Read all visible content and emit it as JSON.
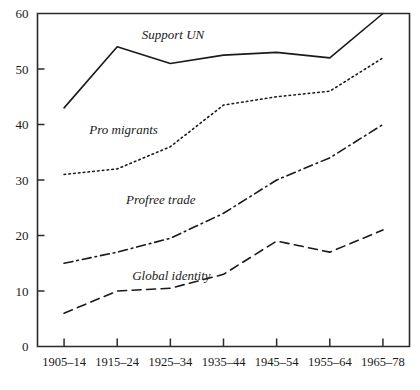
{
  "chart_data": {
    "type": "line",
    "title": "",
    "xlabel": "",
    "ylabel": "",
    "ylim": [
      0,
      60
    ],
    "y_ticks": [
      0,
      10,
      20,
      30,
      40,
      50,
      60
    ],
    "grid": false,
    "legend_position": "inline-labels",
    "categories": [
      "1905–14",
      "1915–24",
      "1925–34",
      "1935–44",
      "1945–54",
      "1955–64",
      "1965–78"
    ],
    "series": [
      {
        "name": "Support UN",
        "style": "solid",
        "color": "#1a1a1a",
        "values": [
          43,
          54,
          51,
          52.5,
          53,
          52,
          60
        ],
        "label_x_index": 2.05,
        "label_y": 55.4
      },
      {
        "name": "Pro migrants",
        "style": "dotted",
        "color": "#1a1a1a",
        "values": [
          31,
          32,
          36,
          43.5,
          45,
          46,
          52
        ],
        "label_x_index": 1.12,
        "label_y": 38.2
      },
      {
        "name": "Profree trade",
        "style": "dash-dot",
        "color": "#1a1a1a",
        "values": [
          15,
          17,
          19.5,
          24,
          30,
          34,
          40
        ],
        "label_x_index": 1.82,
        "label_y": 25.6
      },
      {
        "name": "Global identity",
        "style": "dashed",
        "color": "#1a1a1a",
        "values": [
          6,
          10,
          10.5,
          13,
          19,
          17,
          21
        ],
        "label_x_index": 2.02,
        "label_y": 11.9
      }
    ]
  }
}
